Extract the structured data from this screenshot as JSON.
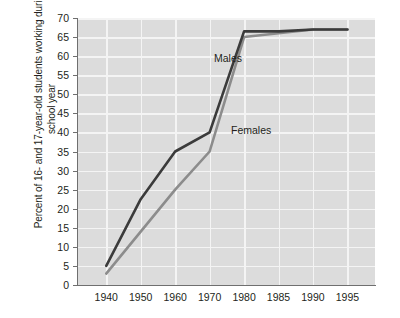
{
  "chart_data": {
    "type": "line",
    "title": "",
    "xlabel": "",
    "ylabel": "Percent of 16- and 17-year-old students working during school year",
    "x": [
      "1940",
      "1950",
      "1960",
      "1970",
      "1980",
      "1985",
      "1990",
      "1995"
    ],
    "xtick_labels": [
      "1940",
      "1950",
      "1960",
      "1970",
      "1980",
      "1985",
      "1990",
      "1995"
    ],
    "ytick_labels": [
      "0",
      "5",
      "10",
      "15",
      "20",
      "25",
      "30",
      "35",
      "40",
      "45",
      "50",
      "55",
      "60",
      "65",
      "70"
    ],
    "ylim": [
      0,
      70
    ],
    "ytick_step": 5,
    "grid": true,
    "legend_position": "inline-annotation",
    "series": [
      {
        "name": "Males",
        "color": "#3b3b3b",
        "values": [
          5,
          22.5,
          35,
          40,
          66.5,
          66.5,
          67,
          67
        ]
      },
      {
        "name": "Females",
        "color": "#8c8c8c",
        "values": [
          3,
          14,
          25,
          35,
          65,
          66,
          67,
          67
        ]
      }
    ],
    "annotations": [
      {
        "text": "Males",
        "x": "1970",
        "y": 56
      },
      {
        "text": "Females",
        "x": "1970",
        "y": 37
      }
    ]
  },
  "style": {
    "plot_background": "#dcdcdc",
    "grid_color": "#f4f4f4",
    "axis_color": "#6f6f6f",
    "text_color": "#231f20",
    "page_background": "#ffffff"
  }
}
